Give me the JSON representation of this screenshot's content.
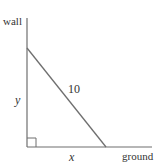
{
  "diagram": {
    "type": "ladder-against-wall",
    "labels": {
      "wall": "wall",
      "ground": "ground",
      "height": "y",
      "base": "x",
      "ladder_length": "10"
    },
    "colors": {
      "line": "#6f6f6f",
      "text": "#333333",
      "background": "#ffffff"
    },
    "geometry": {
      "wall_x": 27,
      "wall_top_y": 18,
      "ground_y": 147,
      "ground_end_x": 152,
      "ladder_top": [
        27,
        48
      ],
      "ladder_bottom": [
        106,
        147
      ],
      "right_angle_size": 9
    }
  }
}
